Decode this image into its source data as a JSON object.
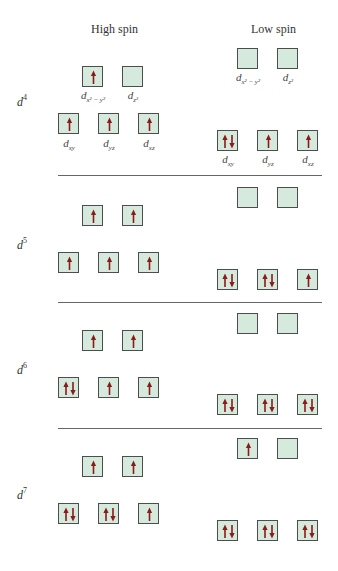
{
  "headings": {
    "high_spin": "High spin",
    "low_spin": "Low spin"
  },
  "colors": {
    "box_fill": "#d5eadc",
    "box_border": "#4d4d4d",
    "arrow": "#8b1a1a",
    "rule": "#666666"
  },
  "orbital_labels": {
    "dx2y2_d": "d",
    "dx2y2_sub": "x² − y²",
    "dz2_d": "d",
    "dz2_sub": "z²",
    "dxy_d": "d",
    "dxy_sub": "xy",
    "dyz_d": "d",
    "dyz_sub": "yz",
    "dxz_d": "d",
    "dxz_sub": "xz"
  },
  "configs": [
    {
      "label_base": "d",
      "label_sup": "4",
      "high_spin": {
        "eg": [
          "up",
          "empty"
        ],
        "t2g": [
          "up",
          "up",
          "up"
        ]
      },
      "low_spin": {
        "eg": [
          "empty",
          "empty"
        ],
        "t2g": [
          "pair",
          "up",
          "up"
        ]
      }
    },
    {
      "label_base": "d",
      "label_sup": "5",
      "high_spin": {
        "eg": [
          "up",
          "up"
        ],
        "t2g": [
          "up",
          "up",
          "up"
        ]
      },
      "low_spin": {
        "eg": [
          "empty",
          "empty"
        ],
        "t2g": [
          "pair",
          "pair",
          "up"
        ]
      }
    },
    {
      "label_base": "d",
      "label_sup": "6",
      "high_spin": {
        "eg": [
          "up",
          "up"
        ],
        "t2g": [
          "pair",
          "up",
          "up"
        ]
      },
      "low_spin": {
        "eg": [
          "empty",
          "empty"
        ],
        "t2g": [
          "pair",
          "pair",
          "pair"
        ]
      }
    },
    {
      "label_base": "d",
      "label_sup": "7",
      "high_spin": {
        "eg": [
          "up",
          "up"
        ],
        "t2g": [
          "pair",
          "pair",
          "up"
        ]
      },
      "low_spin": {
        "eg": [
          "up",
          "empty"
        ],
        "t2g": [
          "pair",
          "pair",
          "pair"
        ]
      }
    }
  ]
}
